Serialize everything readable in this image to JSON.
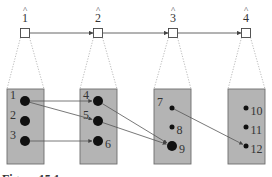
{
  "diagram": {
    "type": "layered mapping diagram",
    "top_nodes": [
      {
        "id": "1",
        "label": "1",
        "hat": "^",
        "x": 25
      },
      {
        "id": "2",
        "label": "2",
        "hat": "^",
        "x": 98
      },
      {
        "id": "3",
        "label": "3",
        "hat": "^",
        "x": 173
      },
      {
        "id": "4",
        "label": "4",
        "hat": "^",
        "x": 246
      }
    ],
    "top_edges": [
      {
        "from": "1",
        "to": "2"
      },
      {
        "from": "2",
        "to": "3"
      },
      {
        "from": "3",
        "to": "4"
      }
    ],
    "groups": [
      {
        "id": "g1",
        "x": 7,
        "w": 37,
        "items": [
          {
            "id": "1",
            "label": "1",
            "r": 5,
            "y": 101,
            "label_side": "left"
          },
          {
            "id": "2",
            "label": "2",
            "r": 5,
            "y": 121,
            "label_side": "left"
          },
          {
            "id": "3",
            "label": "3",
            "r": 5,
            "y": 141,
            "label_side": "left"
          }
        ]
      },
      {
        "id": "g2",
        "x": 80,
        "w": 37,
        "items": [
          {
            "id": "4",
            "label": "4",
            "r": 5,
            "y": 101,
            "label_side": "left"
          },
          {
            "id": "5",
            "label": "5",
            "r": 5,
            "y": 121,
            "label_side": "left"
          },
          {
            "id": "6",
            "label": "6",
            "r": 5,
            "y": 141,
            "label_side": "right"
          }
        ]
      },
      {
        "id": "g3",
        "x": 154,
        "w": 37,
        "items": [
          {
            "id": "7",
            "label": "7",
            "r": 2.5,
            "y": 108,
            "label_side": "left"
          },
          {
            "id": "8",
            "label": "8",
            "r": 2.5,
            "y": 127,
            "label_side": "right"
          },
          {
            "id": "9",
            "label": "9",
            "r": 5,
            "y": 146,
            "label_side": "right"
          }
        ]
      },
      {
        "id": "g4",
        "x": 228,
        "w": 37,
        "items": [
          {
            "id": "10",
            "label": "10",
            "r": 2.5,
            "y": 108,
            "label_side": "right"
          },
          {
            "id": "11",
            "label": "11",
            "r": 2.5,
            "y": 127,
            "label_side": "right"
          },
          {
            "id": "12",
            "label": "12",
            "r": 2.5,
            "y": 146,
            "label_side": "right"
          }
        ]
      }
    ],
    "edges": [
      {
        "from": "1",
        "to": "4"
      },
      {
        "from": "1",
        "to": "5"
      },
      {
        "from": "3",
        "to": "6"
      },
      {
        "from": "4",
        "to": "9"
      },
      {
        "from": "5",
        "to": "9"
      },
      {
        "from": "7",
        "to": "12"
      }
    ],
    "caption": "Figure 15.1"
  },
  "colors": {
    "group_fill": "#b4b4b4",
    "group_stroke": "#6e6e6e",
    "node_fill": "#111111",
    "line": "#555555",
    "dotted": "#aaaaaa"
  }
}
